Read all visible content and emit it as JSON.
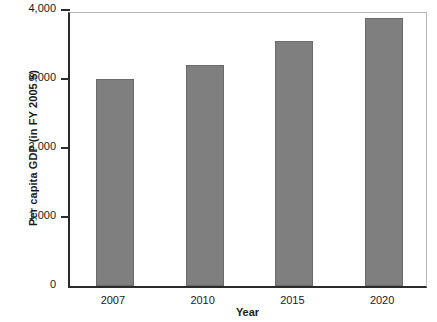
{
  "chart_data": {
    "type": "bar",
    "title": "",
    "subtitle": "",
    "xlabel": "Year",
    "ylabel": "Per capita GDP (in FY 2005 $)",
    "categories": [
      "2007",
      "2010",
      "2015",
      "2020"
    ],
    "values": [
      3000,
      3200,
      3550,
      3890
    ],
    "series": [
      {
        "name": "Per capita GDP",
        "values": [
          3000,
          3200,
          3550,
          3890
        ]
      }
    ],
    "ylim": [
      0,
      4000
    ],
    "ytick_values": [
      0,
      1000,
      2000,
      3000,
      4000
    ],
    "ytick_labels": [
      "0",
      "1,000",
      "2,000",
      "3,000",
      "4,000"
    ],
    "grid": false,
    "legend": false,
    "legend_position": "none",
    "bar_color": "#7f7f7f",
    "bar_edge_color": "#6a6a6a",
    "axis_color": "#2b2b2b",
    "frame_color": "#b9b9b9",
    "background_color": "#ffffff",
    "annotations": []
  }
}
